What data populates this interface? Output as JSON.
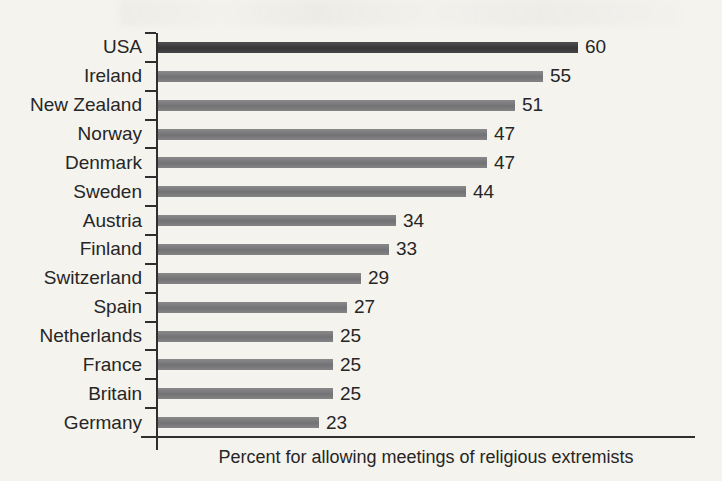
{
  "chart_data": {
    "type": "bar",
    "orientation": "horizontal",
    "title": "",
    "xlabel": "Percent for allowing meetings of religious extremists",
    "ylabel": "",
    "categories": [
      "USA",
      "Ireland",
      "New Zealand",
      "Norway",
      "Denmark",
      "Sweden",
      "Austria",
      "Finland",
      "Switzerland",
      "Spain",
      "Netherlands",
      "France",
      "Britain",
      "Germany"
    ],
    "values": [
      60,
      55,
      51,
      47,
      47,
      44,
      34,
      33,
      29,
      27,
      25,
      25,
      25,
      23
    ],
    "value_labels_shown": true,
    "xlim": [
      0,
      77
    ],
    "grid": false,
    "legend": null,
    "highlight_category": "USA",
    "colors": {
      "bar": "#7c7c7e",
      "highlight_bar": "#3a3a3c",
      "axis": "#2f2f2f",
      "text": "#262626",
      "background": "#f5f3ee"
    }
  }
}
